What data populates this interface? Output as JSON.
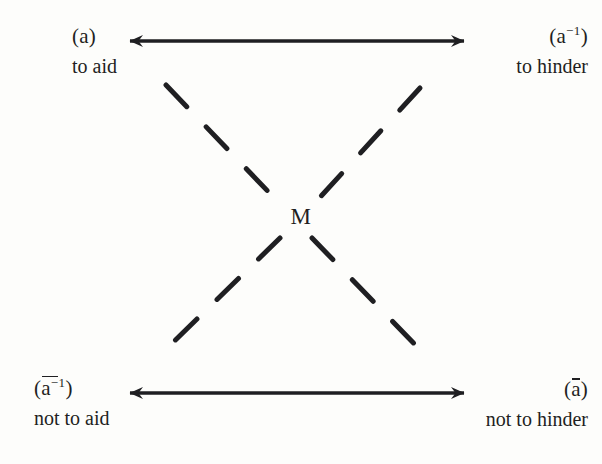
{
  "diagram": {
    "center": {
      "label": "M"
    },
    "corners": {
      "top_left": {
        "symbol_base": "a",
        "symbol_sup": "",
        "negated": false,
        "symbol_text": "(a)",
        "gloss": "to aid"
      },
      "top_right": {
        "symbol_base": "a",
        "symbol_sup": "-1",
        "negated": false,
        "symbol_text": "(a-1)",
        "gloss": "to hinder"
      },
      "bottom_left": {
        "symbol_base": "a",
        "symbol_sup": "-1",
        "negated": true,
        "symbol_text": "(a-1) negated",
        "gloss": "not to aid"
      },
      "bottom_right": {
        "symbol_base": "a",
        "symbol_sup": "",
        "negated": true,
        "symbol_text": "(a) negated",
        "gloss": "not to hinder"
      }
    },
    "connectors": [
      {
        "name": "top-horizontal-arrow",
        "style": "solid",
        "heads": "both",
        "from": "top_left",
        "to": "top_right"
      },
      {
        "name": "bottom-horizontal-arrow",
        "style": "solid",
        "heads": "both",
        "from": "bottom_left",
        "to": "bottom_right"
      },
      {
        "name": "diagonal-tl-br",
        "style": "dashed",
        "heads": "none",
        "from": "top_left",
        "to": "bottom_right"
      },
      {
        "name": "diagonal-tr-bl",
        "style": "dashed",
        "heads": "none",
        "from": "top_right",
        "to": "bottom_left"
      }
    ],
    "paren_open": "(",
    "paren_close": ")",
    "sup_minus_one": "−1",
    "colors": {
      "ink": "#1f1f22",
      "background": "#fdfdfb"
    }
  }
}
